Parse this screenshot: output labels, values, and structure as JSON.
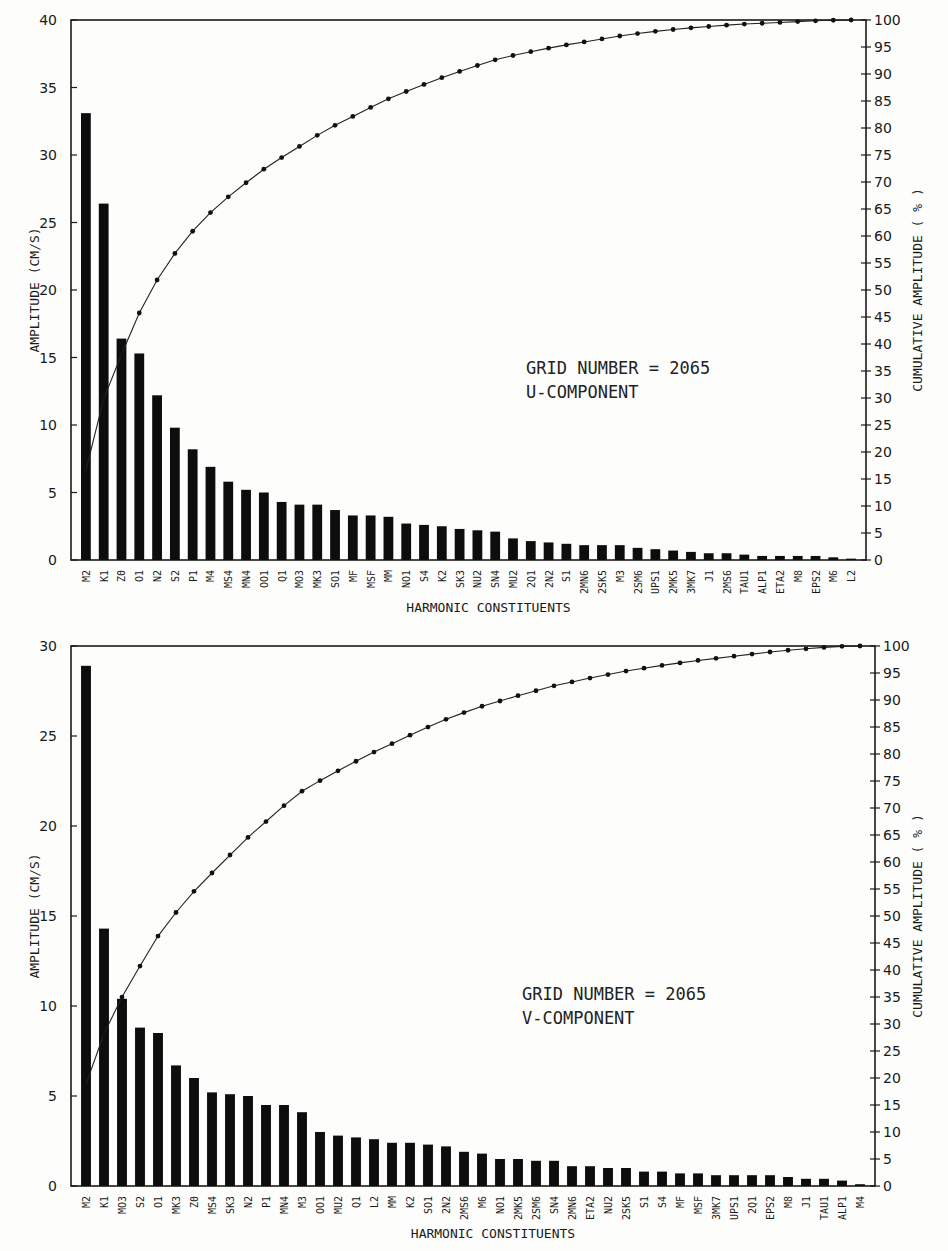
{
  "chart_data": [
    {
      "type": "bar+line",
      "title": "",
      "annotation": [
        "GRID NUMBER = 2065",
        "U-COMPONENT"
      ],
      "xlabel": "HARMONIC CONSTITUENTS",
      "ylabel": "AMPLITUDE   (CM/S)",
      "ylabel_right": "CUMULATIVE AMPLITUDE   ( % )",
      "ylim": [
        0,
        40
      ],
      "yticks": [
        0,
        5,
        10,
        15,
        20,
        25,
        30,
        35,
        40
      ],
      "ylim_right": [
        0,
        100
      ],
      "yticks_right": [
        0,
        5,
        10,
        15,
        20,
        25,
        30,
        35,
        40,
        45,
        50,
        55,
        60,
        65,
        70,
        75,
        80,
        85,
        90,
        95,
        100
      ],
      "grid": false,
      "categories": [
        "M2",
        "K1",
        "Z0",
        "O1",
        "N2",
        "S2",
        "P1",
        "M4",
        "MS4",
        "MN4",
        "OO1",
        "Q1",
        "MO3",
        "MK3",
        "SO1",
        "MF",
        "MSF",
        "MM",
        "NO1",
        "S4",
        "K2",
        "SK3",
        "NU2",
        "SN4",
        "MU2",
        "2Q1",
        "2N2",
        "S1",
        "2MN6",
        "2SK5",
        "M3",
        "2SM6",
        "UPS1",
        "2MK5",
        "3MK7",
        "J1",
        "2MS6",
        "TAU1",
        "ALP1",
        "ETA2",
        "M8",
        "EPS2",
        "M6",
        "L2"
      ],
      "series": [
        {
          "name": "Amplitude (cm/s)",
          "kind": "bar",
          "axis": "left",
          "values": [
            33.1,
            26.4,
            16.4,
            15.3,
            12.2,
            9.8,
            8.2,
            6.9,
            5.8,
            5.2,
            5.0,
            4.3,
            4.1,
            4.1,
            3.7,
            3.3,
            3.3,
            3.2,
            2.7,
            2.6,
            2.5,
            2.3,
            2.2,
            2.1,
            1.6,
            1.4,
            1.3,
            1.2,
            1.1,
            1.1,
            1.1,
            0.9,
            0.8,
            0.7,
            0.6,
            0.5,
            0.5,
            0.4,
            0.3,
            0.3,
            0.3,
            0.3,
            0.2,
            0.1
          ]
        },
        {
          "name": "Cumulative amplitude (%)",
          "kind": "line",
          "axis": "right",
          "values": [
            21.4,
            38.5,
            49.1,
            59.0,
            66.8,
            73.2,
            78.5,
            83.0,
            86.7,
            90.1,
            93.3,
            96.1,
            98.8,
            101.4,
            103.8,
            106.0,
            108.1,
            110.2,
            111.9,
            113.6,
            115.2,
            116.7,
            118.1,
            119.5,
            120.5,
            121.4,
            122.3,
            123.0,
            123.7,
            124.4,
            125.1,
            125.7,
            126.2,
            126.7,
            127.1,
            127.4,
            127.7,
            128.0,
            128.2,
            128.4,
            128.6,
            128.8,
            128.9,
            129.0
          ]
        }
      ]
    },
    {
      "type": "bar+line",
      "title": "",
      "annotation": [
        "GRID NUMBER = 2065",
        "V-COMPONENT"
      ],
      "xlabel": "HARMONIC CONSTITUENTS",
      "ylabel": "AMPLITUDE   (CM/S)",
      "ylabel_right": "CUMULATIVE AMPLITUDE   ( % )",
      "ylim": [
        0,
        30
      ],
      "yticks": [
        0,
        5,
        10,
        15,
        20,
        25,
        30
      ],
      "ylim_right": [
        0,
        100
      ],
      "yticks_right": [
        0,
        5,
        10,
        15,
        20,
        25,
        30,
        35,
        40,
        45,
        50,
        55,
        60,
        65,
        70,
        75,
        80,
        85,
        90,
        95,
        100
      ],
      "grid": false,
      "categories": [
        "M2",
        "K1",
        "MO3",
        "S2",
        "O1",
        "MK3",
        "Z0",
        "MS4",
        "SK3",
        "N2",
        "P1",
        "MN4",
        "M3",
        "OO1",
        "MU2",
        "Q1",
        "L2",
        "MM",
        "K2",
        "SO1",
        "2N2",
        "2MS6",
        "M6",
        "NO1",
        "2MK5",
        "2SM6",
        "SN4",
        "2MN6",
        "ETA2",
        "NU2",
        "2SK5",
        "S1",
        "S4",
        "MF",
        "MSF",
        "3MK7",
        "UPS1",
        "2Q1",
        "EPS2",
        "M8",
        "J1",
        "TAU1",
        "ALP1",
        "M4"
      ],
      "series": [
        {
          "name": "Amplitude (cm/s)",
          "kind": "bar",
          "axis": "left",
          "values": [
            28.9,
            14.3,
            10.4,
            8.8,
            8.5,
            6.7,
            6.0,
            5.2,
            5.1,
            5.0,
            4.5,
            4.5,
            4.1,
            3.0,
            2.8,
            2.7,
            2.6,
            2.4,
            2.4,
            2.3,
            2.2,
            1.9,
            1.8,
            1.5,
            1.5,
            1.4,
            1.4,
            1.1,
            1.1,
            1.0,
            1.0,
            0.8,
            0.8,
            0.7,
            0.7,
            0.6,
            0.6,
            0.6,
            0.6,
            0.5,
            0.4,
            0.4,
            0.3,
            0.1
          ]
        },
        {
          "name": "Cumulative amplitude (%)",
          "kind": "line",
          "axis": "right"
        }
      ]
    }
  ]
}
